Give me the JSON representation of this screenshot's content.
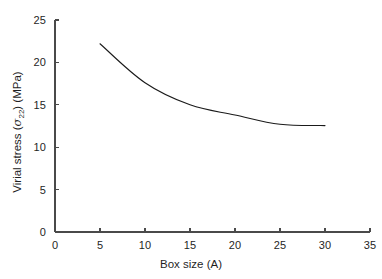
{
  "chart_data": {
    "type": "line",
    "title": "",
    "xlabel": "Box size (A)",
    "ylabel_prefix": "Virial stress (",
    "ylabel_symbol": "σ",
    "ylabel_subscript": "22",
    "ylabel_suffix": ") (MPa)",
    "ylabel": "Virial stress (σ22) (MPa)",
    "xlim": [
      0,
      35
    ],
    "ylim": [
      0,
      25
    ],
    "xticks": [
      0,
      5,
      10,
      15,
      20,
      25,
      30,
      35
    ],
    "yticks": [
      0,
      5,
      10,
      15,
      20,
      25
    ],
    "xtick_labels": [
      "0",
      "5",
      "10",
      "15",
      "20",
      "25",
      "30",
      "35"
    ],
    "ytick_labels": [
      "0",
      "5",
      "10",
      "15",
      "20",
      "25"
    ],
    "grid": false,
    "legend": false,
    "tick_direction": "in",
    "spines": [
      "left",
      "bottom"
    ],
    "series": [
      {
        "name": "Virial stress",
        "color": "#1a1a1a",
        "line_width": 1.1,
        "marker": "none",
        "x": [
          5,
          10,
          15,
          20,
          25,
          30
        ],
        "y": [
          22.2,
          17.6,
          15.0,
          13.8,
          12.7,
          12.55
        ]
      }
    ]
  },
  "figure": {
    "background": "#ffffff",
    "axis_color": "#4a4a4a",
    "text_color": "#1f1f1f"
  }
}
